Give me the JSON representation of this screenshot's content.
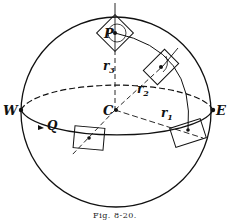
{
  "figure": {
    "caption": "Fig. 8-20.",
    "labels": {
      "west": "W",
      "east": "E",
      "center": "C",
      "pole_point": "P",
      "equator_point": "Q",
      "radius_1": "r",
      "radius_1_sub": "1",
      "radius_2": "r",
      "radius_2_sub": "2",
      "radius_3": "r",
      "radius_3_sub": "3"
    }
  }
}
